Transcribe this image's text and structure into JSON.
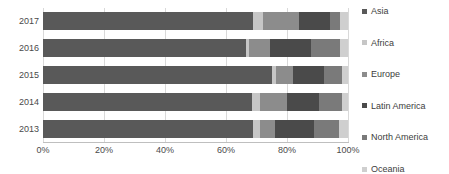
{
  "chart_data": {
    "type": "bar",
    "orientation": "horizontal",
    "stacked": true,
    "normalized_percent": true,
    "title": "",
    "subtitle": "",
    "xlabel": "",
    "ylabel": "",
    "categories": [
      "2017",
      "2016",
      "2015",
      "2014",
      "2013"
    ],
    "xlim": [
      0,
      100
    ],
    "xticks": [
      0,
      20,
      40,
      60,
      80,
      100
    ],
    "xticklabels": [
      "0%",
      "20%",
      "40%",
      "60%",
      "80%",
      "100%"
    ],
    "grid": "vertical",
    "legend_position": "right",
    "series": [
      {
        "name": "Asia",
        "color": "#595959",
        "values": [
          69.0,
          66.5,
          75.0,
          68.5,
          69.0
        ]
      },
      {
        "name": "Africa",
        "color": "#c6c6c6",
        "values": [
          3.0,
          1.0,
          1.5,
          2.5,
          2.0
        ]
      },
      {
        "name": "Europe",
        "color": "#8c8c8c",
        "values": [
          12.0,
          7.0,
          5.5,
          9.0,
          5.0
        ]
      },
      {
        "name": "Latin America",
        "color": "#4a4a4a",
        "values": [
          10.0,
          13.5,
          10.0,
          10.5,
          13.0
        ]
      },
      {
        "name": "North America",
        "color": "#7a7a7a",
        "values": [
          3.5,
          9.5,
          6.0,
          7.5,
          8.0
        ]
      },
      {
        "name": "Oceania",
        "color": "#cfcfcf",
        "values": [
          2.5,
          2.5,
          2.0,
          2.0,
          3.0
        ]
      }
    ]
  },
  "legend": {
    "items": [
      {
        "label": "Asia",
        "marker": "square-swatch"
      },
      {
        "label": "Africa",
        "marker": "square-swatch"
      },
      {
        "label": "Europe",
        "marker": "square-swatch"
      },
      {
        "label": "Latin America",
        "marker": "square-swatch"
      },
      {
        "label": "North America",
        "marker": "square-swatch"
      },
      {
        "label": "Oceania",
        "marker": "square-swatch"
      }
    ]
  }
}
